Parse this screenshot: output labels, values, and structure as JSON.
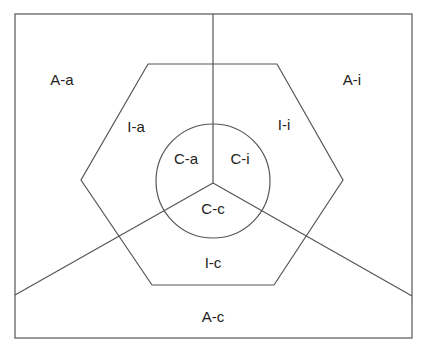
{
  "diagram": {
    "type": "nested-regions",
    "frame": {
      "x": 15,
      "y": 14,
      "width": 397,
      "height": 324
    },
    "hexagon": {
      "points": [
        [
          148,
          64
        ],
        [
          277,
          64
        ],
        [
          343,
          180
        ],
        [
          274,
          285
        ],
        [
          152,
          285
        ],
        [
          81,
          180
        ]
      ]
    },
    "circle": {
      "cx": 213,
      "cy": 181,
      "r": 57
    },
    "junction": {
      "x": 213,
      "y": 183
    },
    "radial_lines": [
      {
        "name": "top",
        "x2": 213,
        "y2": 14
      },
      {
        "name": "left",
        "x2": 15,
        "y2": 295
      },
      {
        "name": "right",
        "x2": 412,
        "y2": 296
      }
    ],
    "colors": {
      "line": "#555555",
      "text": "#222222",
      "background": "#ffffff"
    },
    "labels": {
      "outer_a": "A-a",
      "outer_i": "A-i",
      "outer_c": "A-c",
      "inner_a": "I-a",
      "inner_i": "I-i",
      "inner_c": "I-c",
      "core_a": "C-a",
      "core_i": "C-i",
      "core_c": "C-c"
    }
  }
}
